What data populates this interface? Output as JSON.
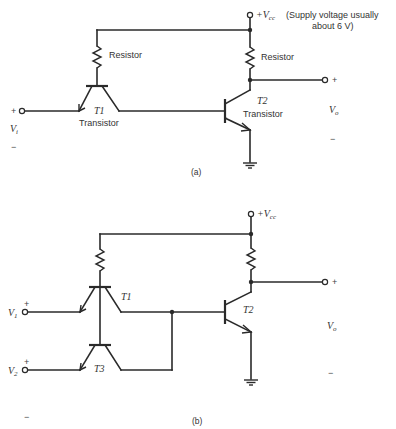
{
  "figure_a": {
    "caption": "(a)",
    "supply": {
      "label": "+V",
      "sub": "cc",
      "note_line1": "(Supply voltage usually",
      "note_line2": "about 6 V)"
    },
    "resistor_left_label": "Resistor",
    "resistor_right_label": "Resistor",
    "t1": {
      "name": "T1",
      "desc": "Transistor"
    },
    "t2": {
      "name": "T2",
      "desc": "Transistor"
    },
    "input": {
      "plus": "+",
      "label": "V",
      "sub": "i",
      "minus": "−"
    },
    "output": {
      "plus": "+",
      "label": "V",
      "sub": "o",
      "minus": "−"
    }
  },
  "figure_b": {
    "caption": "(b)",
    "supply": {
      "label": "+V",
      "sub": "cc"
    },
    "t1": {
      "name": "T1"
    },
    "t2": {
      "name": "T2"
    },
    "t3": {
      "name": "T3"
    },
    "input1": {
      "plus": "+",
      "label": "V",
      "sub": "1"
    },
    "input2": {
      "plus": "+",
      "label": "V",
      "sub": "2"
    },
    "minus": "−",
    "output": {
      "plus": "+",
      "label": "V",
      "sub": "o",
      "minus": "−"
    }
  }
}
